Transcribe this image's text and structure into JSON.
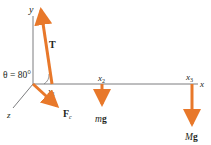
{
  "diagram": {
    "type": "free-body-diagram",
    "colors": {
      "axis": "#6d6e70",
      "force": "#e8782a",
      "text": "#231f20"
    },
    "axes": {
      "x_label": "x",
      "y_label": "y",
      "z_label": "z"
    },
    "angle_label": "θ = 80°",
    "positions": {
      "x1": "x",
      "x1_sub": "1",
      "x2": "x",
      "x2_sub": "2",
      "x3": "x",
      "x3_sub": "3"
    },
    "forces": {
      "tension": "T",
      "contact": "F",
      "contact_sub": "c",
      "small_weight_m": "m",
      "small_weight_g": "g",
      "large_weight_M": "M",
      "large_weight_g": "g"
    }
  }
}
